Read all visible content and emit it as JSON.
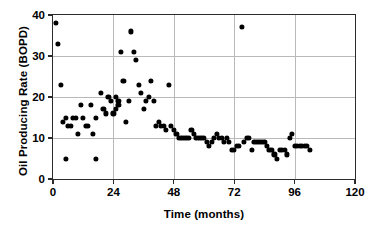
{
  "chart_data": {
    "type": "scatter",
    "title": "",
    "xlabel": "Time (months)",
    "ylabel": "Oil Producing Rate (BOPD)",
    "xlim": [
      0,
      120
    ],
    "ylim": [
      0,
      40
    ],
    "xticks": [
      0,
      24,
      48,
      72,
      96,
      120
    ],
    "yticks": [
      0,
      10,
      20,
      30,
      40
    ],
    "grid": true,
    "legend": null,
    "marker": "filled-circle",
    "marker_color": "#000000",
    "series": [
      {
        "name": "Oil Producing Rate",
        "points": [
          [
            1,
            38
          ],
          [
            2,
            33
          ],
          [
            3,
            23
          ],
          [
            4,
            14
          ],
          [
            5,
            15
          ],
          [
            5,
            5
          ],
          [
            6,
            13
          ],
          [
            7,
            13
          ],
          [
            8,
            15
          ],
          [
            9,
            15
          ],
          [
            10,
            11
          ],
          [
            11,
            18
          ],
          [
            12,
            15
          ],
          [
            13,
            13
          ],
          [
            14,
            13
          ],
          [
            15,
            18
          ],
          [
            16,
            11
          ],
          [
            17,
            15
          ],
          [
            17,
            5
          ],
          [
            19,
            21
          ],
          [
            20,
            17
          ],
          [
            21,
            16
          ],
          [
            22,
            20
          ],
          [
            23,
            19
          ],
          [
            24,
            16
          ],
          [
            25,
            20
          ],
          [
            25,
            17
          ],
          [
            26,
            19
          ],
          [
            26,
            18
          ],
          [
            27,
            31
          ],
          [
            28,
            24
          ],
          [
            29,
            14
          ],
          [
            30,
            19
          ],
          [
            31,
            36
          ],
          [
            32,
            31
          ],
          [
            33,
            29
          ],
          [
            34,
            23
          ],
          [
            35,
            21
          ],
          [
            36,
            17
          ],
          [
            37,
            19
          ],
          [
            38,
            20
          ],
          [
            39,
            24
          ],
          [
            40,
            19
          ],
          [
            41,
            13
          ],
          [
            42,
            14
          ],
          [
            43,
            13
          ],
          [
            44,
            13
          ],
          [
            45,
            12
          ],
          [
            46,
            23
          ],
          [
            47,
            13
          ],
          [
            48,
            12
          ],
          [
            49,
            11
          ],
          [
            50,
            10
          ],
          [
            51,
            10
          ],
          [
            52,
            10
          ],
          [
            53,
            10
          ],
          [
            54,
            10
          ],
          [
            55,
            12
          ],
          [
            56,
            11
          ],
          [
            57,
            10
          ],
          [
            58,
            10
          ],
          [
            59,
            10
          ],
          [
            60,
            10
          ],
          [
            61,
            9
          ],
          [
            62,
            8
          ],
          [
            63,
            9
          ],
          [
            64,
            10
          ],
          [
            65,
            11
          ],
          [
            66,
            10
          ],
          [
            67,
            10
          ],
          [
            68,
            9
          ],
          [
            69,
            10
          ],
          [
            70,
            9
          ],
          [
            71,
            7
          ],
          [
            72,
            7
          ],
          [
            73,
            8
          ],
          [
            74,
            8
          ],
          [
            75,
            37
          ],
          [
            76,
            9
          ],
          [
            77,
            10
          ],
          [
            78,
            10
          ],
          [
            79,
            7
          ],
          [
            80,
            9
          ],
          [
            81,
            9
          ],
          [
            82,
            9
          ],
          [
            83,
            9
          ],
          [
            84,
            9
          ],
          [
            85,
            8
          ],
          [
            86,
            7
          ],
          [
            87,
            7
          ],
          [
            88,
            6
          ],
          [
            89,
            5
          ],
          [
            90,
            7
          ],
          [
            91,
            7
          ],
          [
            92,
            7
          ],
          [
            93,
            6
          ],
          [
            94,
            10
          ],
          [
            95,
            11
          ],
          [
            96,
            8
          ],
          [
            97,
            8
          ],
          [
            98,
            8
          ],
          [
            99,
            8
          ],
          [
            100,
            8
          ],
          [
            101,
            8
          ],
          [
            102,
            7
          ]
        ]
      }
    ]
  },
  "axes": {
    "y_tick_labels": [
      "0",
      "10",
      "20",
      "30",
      "40"
    ],
    "x_tick_labels": [
      "0",
      "24",
      "48",
      "72",
      "96",
      "120"
    ]
  }
}
